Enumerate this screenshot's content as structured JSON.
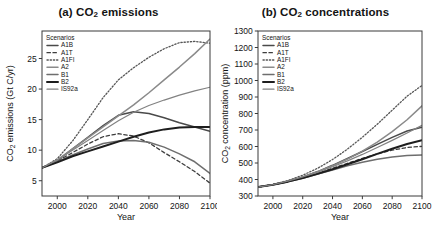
{
  "figure": {
    "background": "#ffffff",
    "panels": [
      "a",
      "b"
    ]
  },
  "panel_a": {
    "title_prefix": "(a) CO",
    "title_sub": "2",
    "title_suffix": " emissions"
  },
  "panel_b": {
    "title_prefix": "(b) CO",
    "title_sub": "2",
    "title_suffix": " concentrations"
  },
  "legend": {
    "header": "Scenarios",
    "entries": [
      {
        "label": "A1B",
        "color": "#4a4a4a",
        "dash": "none",
        "width": 1.5
      },
      {
        "label": "A1T",
        "color": "#3d3d3d",
        "dash": "dashed",
        "width": 1.3
      },
      {
        "label": "A1FI",
        "color": "#555555",
        "dash": "dotted",
        "width": 1.3
      },
      {
        "label": "A2",
        "color": "#8a8a8a",
        "dash": "none",
        "width": 1.5
      },
      {
        "label": "B1",
        "color": "#6e6e6e",
        "dash": "none",
        "width": 1.5
      },
      {
        "label": "B2",
        "color": "#1e1e1e",
        "dash": "none",
        "width": 2.0
      },
      {
        "label": "IS92a",
        "color": "#828282",
        "dash": "none",
        "width": 1.2
      }
    ]
  },
  "chart_data": [
    {
      "type": "line",
      "panel": "a",
      "title": "(a) CO2 emissions",
      "xlabel": "Year",
      "ylabel": "CO2 emissions (Gt C/yr)",
      "xlim": [
        1990,
        2100
      ],
      "ylim": [
        2.5,
        29.5
      ],
      "xticks": [
        2000,
        2020,
        2040,
        2060,
        2080,
        2100
      ],
      "yticks": [
        5,
        10,
        15,
        20,
        25
      ],
      "grid": false,
      "legend_position": "top-left-inside",
      "x": [
        1990,
        2000,
        2010,
        2020,
        2030,
        2040,
        2050,
        2060,
        2070,
        2080,
        2090,
        2100
      ],
      "series": [
        {
          "name": "A1B",
          "values": [
            7.1,
            8.3,
            10.2,
            12.1,
            14.0,
            15.7,
            16.3,
            16.0,
            15.3,
            14.5,
            13.8,
            13.1
          ]
        },
        {
          "name": "A1T",
          "values": [
            7.1,
            8.2,
            9.6,
            11.0,
            12.2,
            12.7,
            12.3,
            11.2,
            9.6,
            8.1,
            6.5,
            4.6
          ]
        },
        {
          "name": "A1FI",
          "values": [
            7.1,
            8.6,
            11.5,
            15.0,
            18.6,
            21.5,
            23.5,
            25.2,
            26.6,
            27.6,
            27.8,
            27.5
          ]
        },
        {
          "name": "A2",
          "values": [
            7.1,
            8.4,
            10.2,
            12.0,
            13.8,
            15.6,
            17.4,
            19.4,
            21.5,
            23.6,
            25.8,
            28.2
          ]
        },
        {
          "name": "B1",
          "values": [
            7.1,
            8.1,
            9.2,
            10.2,
            11.1,
            11.5,
            11.6,
            11.3,
            10.5,
            9.4,
            8.1,
            6.2
          ]
        },
        {
          "name": "B2",
          "values": [
            7.1,
            8.0,
            9.0,
            9.8,
            10.6,
            11.4,
            12.2,
            12.9,
            13.4,
            13.7,
            13.8,
            13.8
          ]
        },
        {
          "name": "IS92a",
          "values": [
            7.1,
            8.4,
            10.0,
            11.6,
            13.2,
            14.8,
            16.2,
            17.3,
            18.2,
            19.0,
            19.7,
            20.3
          ]
        }
      ]
    },
    {
      "type": "line",
      "panel": "b",
      "title": "(b) CO2 concentrations",
      "xlabel": "Year",
      "ylabel": "CO2 concentration (ppm)",
      "xlim": [
        1990,
        2100
      ],
      "ylim": [
        300,
        1300
      ],
      "xticks": [
        2000,
        2020,
        2040,
        2060,
        2080,
        2100
      ],
      "yticks": [
        300,
        400,
        500,
        600,
        700,
        800,
        900,
        1000,
        1100,
        1200,
        1300
      ],
      "grid": false,
      "legend_position": "top-left-inside",
      "x": [
        1990,
        2000,
        2010,
        2020,
        2030,
        2040,
        2050,
        2060,
        2070,
        2080,
        2090,
        2100
      ],
      "series": [
        {
          "name": "A1B",
          "values": [
            354,
            369,
            390,
            416,
            448,
            486,
            527,
            570,
            613,
            655,
            694,
            717
          ]
        },
        {
          "name": "A1T",
          "values": [
            354,
            368,
            387,
            411,
            438,
            468,
            498,
            528,
            555,
            578,
            594,
            601
          ]
        },
        {
          "name": "A1FI",
          "values": [
            354,
            370,
            394,
            426,
            468,
            521,
            584,
            656,
            735,
            820,
            905,
            970
          ]
        },
        {
          "name": "A2",
          "values": [
            354,
            369,
            390,
            416,
            447,
            483,
            524,
            572,
            627,
            690,
            762,
            846
          ]
        },
        {
          "name": "B1",
          "values": [
            354,
            368,
            386,
            408,
            433,
            458,
            483,
            504,
            523,
            537,
            545,
            549
          ]
        },
        {
          "name": "B2",
          "values": [
            354,
            368,
            387,
            409,
            434,
            462,
            492,
            523,
            555,
            586,
            615,
            638
          ]
        },
        {
          "name": "IS92a",
          "values": [
            354,
            369,
            390,
            415,
            444,
            477,
            513,
            552,
            594,
            637,
            682,
            728
          ]
        }
      ]
    }
  ]
}
